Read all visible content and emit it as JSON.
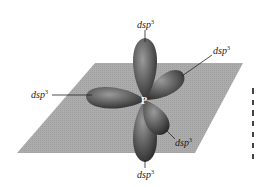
{
  "figure": {
    "center_atom": "P",
    "orbital_label": "dsp",
    "orbital_label_superscript": "3",
    "orbitals": [
      {
        "position": "top",
        "label": "dsp³"
      },
      {
        "position": "upper-right",
        "label": "dsp³"
      },
      {
        "position": "left",
        "label": "dsp³"
      },
      {
        "position": "lower-right",
        "label": "dsp³"
      },
      {
        "position": "bottom",
        "label": "dsp³"
      }
    ],
    "colors": {
      "plane": "#a9a9a9",
      "lobe_dark": "#3e3e3e",
      "lobe_mid": "#6a6a6a",
      "lobe_light": "#9a9a9a",
      "leader_line": "#222222"
    }
  },
  "caption_fragment": [
    "",
    "",
    "",
    "",
    "",
    ""
  ]
}
